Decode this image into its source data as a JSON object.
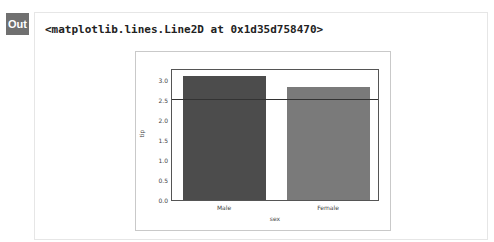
{
  "cell": {
    "prompt_label": "Out",
    "repr": "<matplotlib.lines.Line2D at 0x1d35d758470>"
  },
  "colors": {
    "male_bar": "#4c4c4c",
    "female_bar": "#7a7a7a",
    "hline": "#333333",
    "badge": "#707070"
  },
  "chart_data": {
    "type": "bar",
    "categories": [
      "Male",
      "Female"
    ],
    "values": [
      3.09,
      2.83
    ],
    "title": "",
    "xlabel": "sex",
    "ylabel": "tip",
    "ylim": [
      0,
      3.25
    ],
    "yticks": [
      "0.0",
      "0.5",
      "1.0",
      "1.5",
      "2.0",
      "2.5",
      "3.0"
    ],
    "annotations": [
      {
        "type": "axhline",
        "y": 2.5
      }
    ],
    "grid": false,
    "legend": null
  }
}
